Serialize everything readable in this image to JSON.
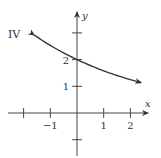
{
  "graph": {
    "label": "IV",
    "x_axis_label": "x",
    "y_axis_label": "y",
    "x_ticks": [
      {
        "value": -2,
        "label": ""
      },
      {
        "value": -1,
        "label": "−1"
      },
      {
        "value": 1,
        "label": "1"
      },
      {
        "value": 2,
        "label": "2"
      }
    ],
    "y_ticks": [
      {
        "value": -1,
        "label": ""
      },
      {
        "value": 1,
        "label": "1"
      },
      {
        "value": 2,
        "label": "2"
      },
      {
        "value": 3,
        "label": ""
      }
    ],
    "curve": {
      "description": "decreasing exponential through (0, 2)",
      "y_intercept": 2,
      "x_start": -1.6,
      "x_end": 2.4,
      "arrows": "both ends"
    },
    "colors": {
      "axes": "#444444",
      "curve": "#333333",
      "text": "#333333"
    }
  }
}
